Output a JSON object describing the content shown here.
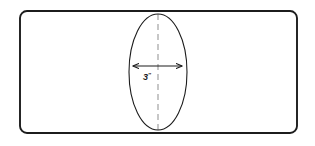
{
  "diagram": {
    "type": "technical-line-drawing",
    "background_color": "#ffffff",
    "ink_color": "#1c1c1c",
    "centerline_color": "#9a9a9a",
    "outer_plate": {
      "name": "rounded-rectangle-outline",
      "x": 20,
      "y": 11,
      "width": 277,
      "height": 122,
      "corner_radius": 7,
      "stroke_width": 1.9,
      "fill": "none"
    },
    "ellipse": {
      "name": "vertical-ellipse",
      "cx": 158,
      "cy": 72,
      "rx": 29,
      "ry": 58,
      "stroke_width": 1.1,
      "fill": "none"
    },
    "centerline": {
      "name": "vertical-dashed-centerline",
      "x": 158,
      "y1": 14,
      "y2": 131,
      "stroke_width": 1.1,
      "dash": "6 4"
    },
    "dimension": {
      "name": "width-dimension-arrow",
      "x1": 133,
      "x2": 182,
      "y": 66,
      "stroke_width": 1.1,
      "arrowheads": "both",
      "label_value": "3",
      "label_unit": "″",
      "label_full": "3″",
      "label_x": 147,
      "label_y": 80
    }
  }
}
